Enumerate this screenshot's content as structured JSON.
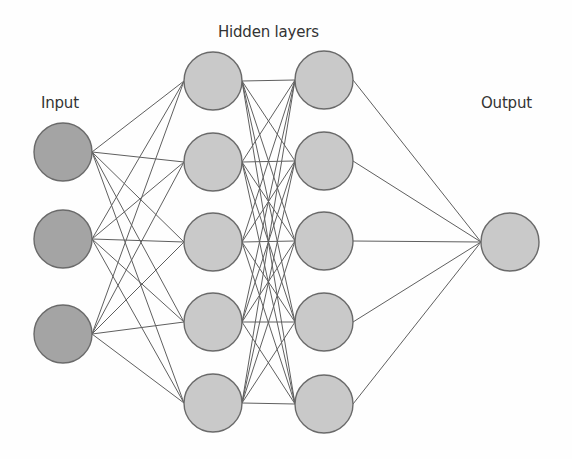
{
  "diagram": {
    "labels": {
      "input": "Input",
      "hidden": "Hidden layers",
      "output": "Output"
    },
    "colors": {
      "input_fill": "#a4a4a4",
      "hidden_fill": "#c9c9c9",
      "output_fill": "#c9c9c9",
      "node_stroke": "#6a6a6a",
      "edge_stroke": "#5f5f5f",
      "label_text": "#333333"
    },
    "node_radius": 29,
    "layers": [
      {
        "name": "input",
        "fill_key": "input_fill",
        "nodes": [
          {
            "cx": 63,
            "cy": 152
          },
          {
            "cx": 63,
            "cy": 239
          },
          {
            "cx": 63,
            "cy": 334
          }
        ]
      },
      {
        "name": "hidden-1",
        "fill_key": "hidden_fill",
        "nodes": [
          {
            "cx": 213,
            "cy": 81
          },
          {
            "cx": 213,
            "cy": 162
          },
          {
            "cx": 213,
            "cy": 242
          },
          {
            "cx": 213,
            "cy": 322
          },
          {
            "cx": 213,
            "cy": 403
          }
        ]
      },
      {
        "name": "hidden-2",
        "fill_key": "hidden_fill",
        "nodes": [
          {
            "cx": 324,
            "cy": 80
          },
          {
            "cx": 324,
            "cy": 161
          },
          {
            "cx": 324,
            "cy": 241
          },
          {
            "cx": 324,
            "cy": 322
          },
          {
            "cx": 324,
            "cy": 404
          }
        ]
      },
      {
        "name": "output",
        "fill_key": "output_fill",
        "nodes": [
          {
            "cx": 510,
            "cy": 242
          }
        ]
      }
    ],
    "connectivity": "fully-connected between adjacent layers"
  }
}
